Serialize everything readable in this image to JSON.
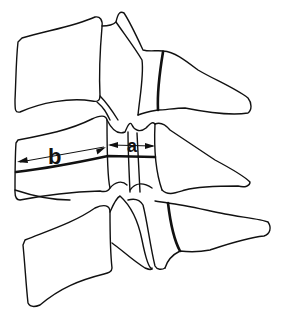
{
  "diagram": {
    "labels": {
      "a": "a",
      "b": "b"
    },
    "measurements": [
      {
        "id": "a",
        "description": "horizontal span between arrowheads across posterior element"
      },
      {
        "id": "b",
        "description": "span across vertebral body"
      }
    ],
    "colors": {
      "line": "#111111",
      "background": "#ffffff"
    }
  }
}
